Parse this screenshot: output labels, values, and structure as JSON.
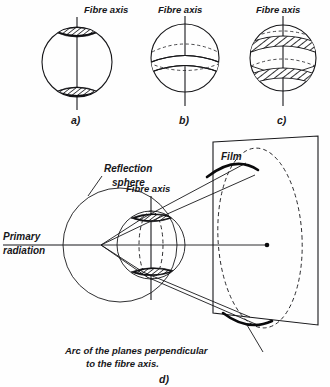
{
  "figure": {
    "caption_letters": {
      "a": "a)",
      "b": "b)",
      "c": "c)",
      "d": "d)"
    },
    "panels": [
      {
        "id": "panel-a",
        "letter": "a)",
        "axis_label": "Fibre axis",
        "description": "Sphere with small hatched reflection caps at both poles"
      },
      {
        "id": "panel-b",
        "letter": "b)",
        "axis_label": "Fibre axis",
        "description": "Sphere with a single broad hatched band below the equator"
      },
      {
        "id": "panel-c",
        "letter": "c)",
        "axis_label": "Fibre axis",
        "description": "Sphere with two hatched bands above and below the equator"
      }
    ],
    "main": {
      "letter": "d)",
      "labels": {
        "reflection_sphere": "Reflection\nsphere",
        "reflection_sphere_line1": "Reflection",
        "reflection_sphere_line2": "sphere",
        "fibre_axis": "Fibre axis",
        "film": "Film",
        "primary_radiation_line1": "Primary",
        "primary_radiation_line2": "radiation",
        "arc_caption_line1": "Arc of the planes perpendicular",
        "arc_caption_line2": "to the fibre axis."
      }
    },
    "colors": {
      "ink": "#17171a",
      "ink_dark": "#0a0a0c",
      "paper": "#fefefe"
    }
  }
}
